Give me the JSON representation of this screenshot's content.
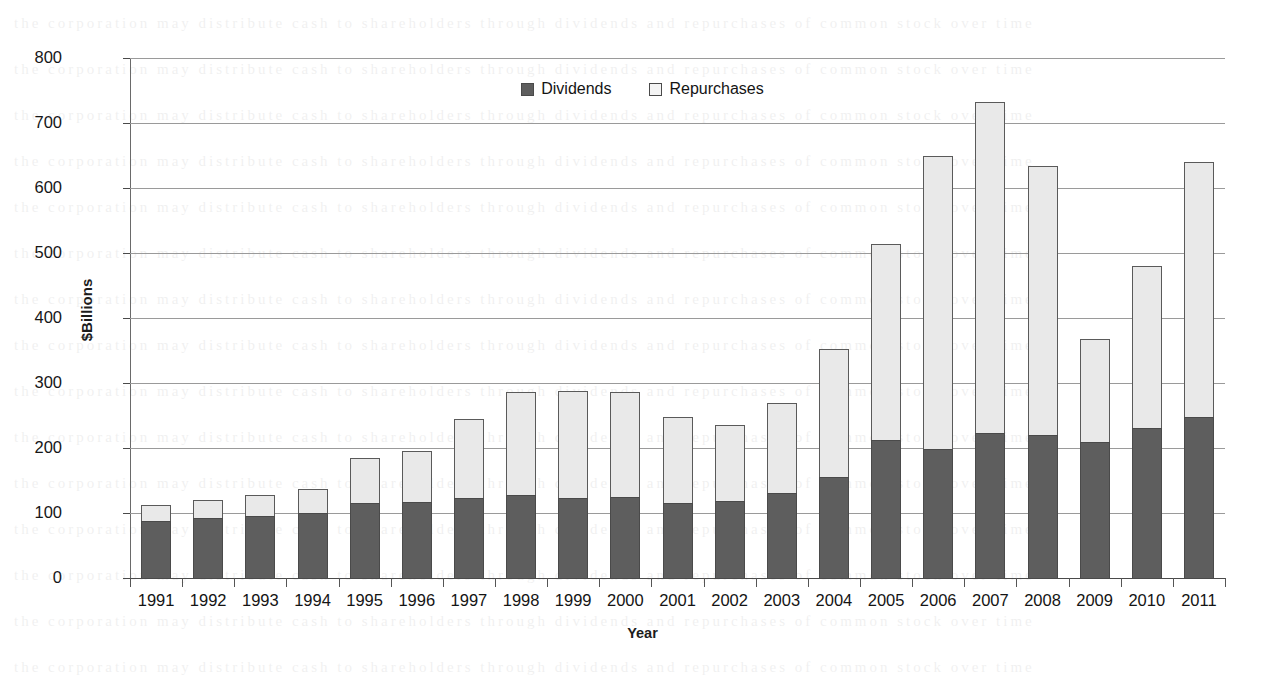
{
  "chart_data": {
    "type": "bar",
    "subtype": "stacked-vertical",
    "title": "",
    "xlabel": "Year",
    "ylabel": "$Billions",
    "ylim": [
      0,
      800
    ],
    "ytick_step": 100,
    "yticks": [
      "800",
      "700",
      "600",
      "500",
      "400",
      "300",
      "200",
      "100",
      "0"
    ],
    "grid": "horizontal",
    "legend_position": "top-center",
    "categories": [
      "1991",
      "1992",
      "1993",
      "1994",
      "1995",
      "1996",
      "1997",
      "1998",
      "1999",
      "2000",
      "2001",
      "2002",
      "2003",
      "2004",
      "2005",
      "2006",
      "2007",
      "2008",
      "2009",
      "2010",
      "2011"
    ],
    "series": [
      {
        "name": "Dividends",
        "color": "#5e5e5e",
        "values": [
          88,
          92,
          95,
          100,
          115,
          117,
          123,
          128,
          123,
          124,
          115,
          118,
          131,
          155,
          212,
          199,
          223,
          220,
          210,
          231,
          247
        ]
      },
      {
        "name": "Repurchases",
        "color": "#e9e9e9",
        "values": [
          24,
          28,
          32,
          37,
          70,
          79,
          122,
          158,
          164,
          162,
          133,
          118,
          138,
          197,
          302,
          451,
          509,
          414,
          157,
          249,
          393
        ]
      }
    ],
    "totals": [
      112,
      120,
      127,
      137,
      185,
      196,
      245,
      286,
      287,
      286,
      248,
      236,
      269,
      352,
      514,
      650,
      732,
      634,
      367,
      480,
      640
    ]
  },
  "legend": {
    "items": [
      {
        "label": "Dividends",
        "swatch": "dividends"
      },
      {
        "label": "Repurchases",
        "swatch": "repurchases"
      }
    ]
  },
  "axes": {
    "y_title": "$Billions",
    "x_title": "Year"
  }
}
